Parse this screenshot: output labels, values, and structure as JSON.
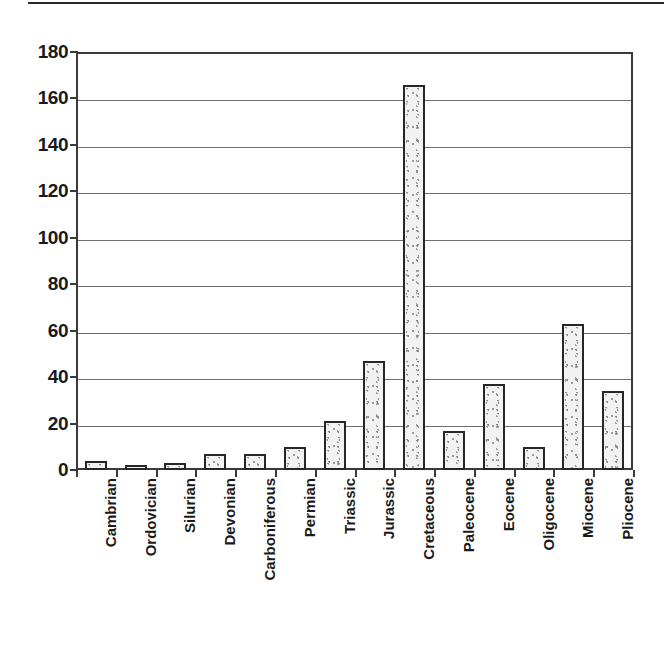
{
  "figure": {
    "has_top_rule": true,
    "background_color": "#ffffff",
    "bar_fill_color": "#f2f2f2",
    "bar_border_color": "#262626",
    "axis_color": "#3a3a3a",
    "gridline_color": "#6f6f6f",
    "text_color": "#1a1a1a"
  },
  "chart_data": {
    "type": "bar",
    "title": "",
    "subtitle": "",
    "xlabel": "",
    "ylabel": "",
    "ylim": [
      0,
      180
    ],
    "ytick_values": [
      0,
      20,
      40,
      60,
      80,
      100,
      120,
      140,
      160,
      180
    ],
    "ytick_labels": [
      "0",
      "20",
      "40",
      "60",
      "80",
      "100",
      "120",
      "140",
      "160",
      "180"
    ],
    "grid": true,
    "grid_axis": "y",
    "legend": false,
    "legend_position": "none",
    "label_rotation": 90,
    "categories": [
      "Cambrian",
      "Ordovician",
      "Silurian",
      "Devonian",
      "Carboniferous",
      "Permian",
      "Triassic",
      "Jurassic",
      "Cretaceous",
      "Paleocene",
      "Eocene",
      "Oligocene",
      "Miocene",
      "Pliocene"
    ],
    "values": [
      4,
      2,
      3,
      7,
      7,
      10,
      21,
      47,
      166,
      17,
      37,
      10,
      63,
      34
    ],
    "annotations": []
  }
}
